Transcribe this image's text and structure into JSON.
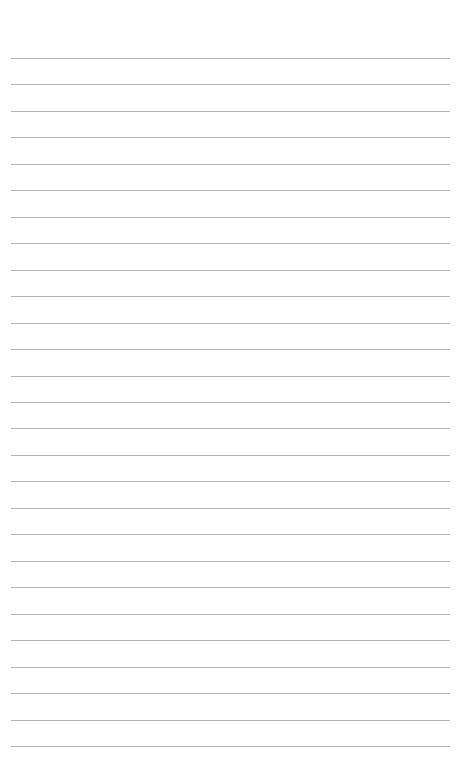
{
  "page": {
    "type": "lined-paper",
    "background_color": "#ffffff",
    "line_color": "#b4b4b4",
    "line_count": 27,
    "first_line_y": 58,
    "line_spacing": 26.46,
    "line_left": 11,
    "line_right": 450
  }
}
